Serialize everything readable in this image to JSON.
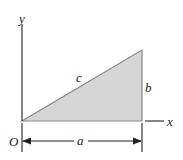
{
  "diagram": {
    "labels": {
      "y_axis": "y",
      "x_axis": "x",
      "origin": "O",
      "hypotenuse": "c",
      "height": "b",
      "base": "a"
    },
    "colors": {
      "fill": "#d4d4d4",
      "stroke": "#888888",
      "axis": "#333333"
    }
  }
}
